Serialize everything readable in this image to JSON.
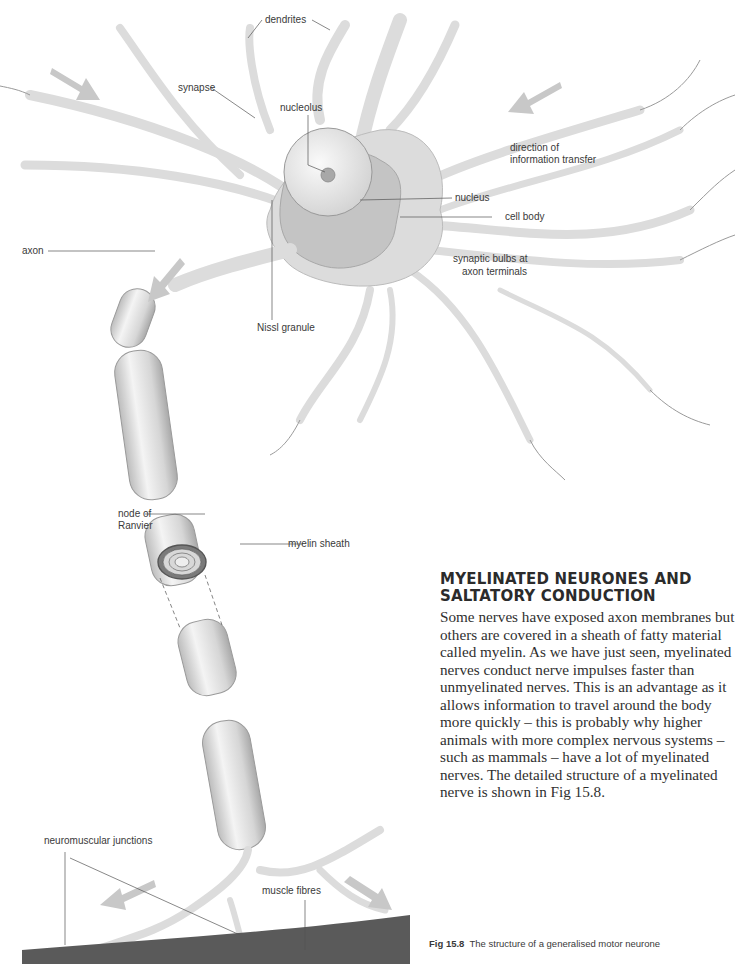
{
  "diagram": {
    "labels": {
      "dendrites": "dendrites",
      "synapse": "synapse",
      "nucleolus": "nucleolus",
      "direction": "direction of",
      "direction2": "information transfer",
      "nucleus": "nucleus",
      "cell_body": "cell body",
      "axon": "axon",
      "synaptic_bulbs": "synaptic bulbs at",
      "synaptic_bulbs2": "axon terminals",
      "nissl": "Nissl granule",
      "node": "node of",
      "node2": "Ranvier",
      "myelin": "myelin sheath",
      "nmj": "neuromuscular junctions",
      "muscle": "muscle fibres"
    },
    "colors": {
      "cell_fill": "#dcdcdc",
      "nucleus_region": "#c4c4c4",
      "arrow": "#c8c8c8",
      "muscle": "#5a5a5a"
    }
  },
  "article": {
    "heading_line1": "MYELINATED NEURONES AND",
    "heading_line2": "SALTATORY CONDUCTION",
    "body": "Some nerves have exposed axon membranes but others are covered in a sheath of fatty material called myelin. As we have just seen, myelinated nerves conduct nerve impulses faster than unmyelinated nerves. This is an advantage as it allows information to travel around the body more quickly – this is probably why higher animals with more complex nervous systems – such as mammals – have a lot of myelinated nerves. The detailed structure of a myelinated nerve is shown in Fig 15.8."
  },
  "caption": {
    "fig_number": "Fig 15.8",
    "text": "The structure of a generalised motor neurone"
  }
}
